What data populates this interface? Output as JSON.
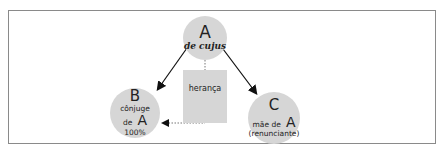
{
  "nodes": {
    "a": {
      "letter": "A",
      "label": "de cujus"
    },
    "b": {
      "letter": "B",
      "line1": "cônjuge",
      "line2": "de",
      "letter2": "A",
      "line3": "100%"
    },
    "c": {
      "letter": "C",
      "line1": "mãe de",
      "letter2": "A",
      "line2": "(renunciante)"
    }
  },
  "box": {
    "label": "herança"
  },
  "colors": {
    "node_fill": "#d6d6d6",
    "frame": "#8a8a8a",
    "arrow": "#111111"
  }
}
